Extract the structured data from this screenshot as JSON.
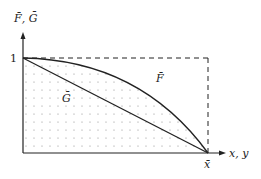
{
  "diagram": {
    "y_axis_label": "F̄, Ḡ",
    "x_axis_label": "x, y",
    "y_tick": "1",
    "x_tick": "x̄",
    "curve_F_label": "F̄",
    "line_G_label": "Ḡ"
  }
}
